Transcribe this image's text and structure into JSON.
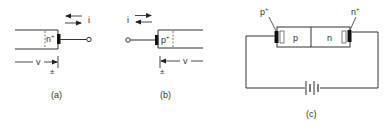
{
  "figure": {
    "panel_a": {
      "caption": "(a)",
      "region_label": "n",
      "region_sup": "+",
      "current_label": "i",
      "voltage_label": "v",
      "sign_label": "±"
    },
    "panel_b": {
      "caption": "(b)",
      "region_label": "p",
      "region_sup": "+",
      "current_label": "i",
      "voltage_label": "v",
      "sign_label": "±"
    },
    "panel_c": {
      "caption": "(c)",
      "p_plus_label": "p",
      "p_plus_sup": "+",
      "n_plus_label": "n",
      "n_plus_sup": "+",
      "p_region": "p",
      "n_region": "n"
    }
  },
  "colors": {
    "line": "#333333",
    "contact": "#111111",
    "background": "#ffffff"
  }
}
